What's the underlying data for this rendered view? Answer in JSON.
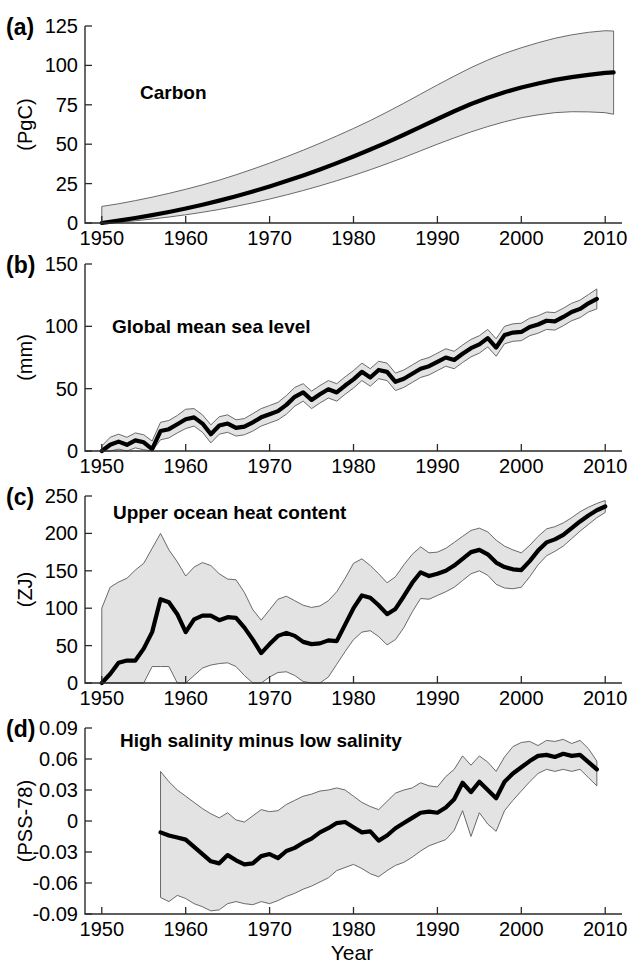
{
  "figure": {
    "x_axis_title": "Year",
    "x_ticks": [
      1950,
      1960,
      1970,
      1980,
      1990,
      2000,
      2010
    ],
    "x_range": [
      1948,
      2012
    ],
    "band_fill": "#e3e3e3",
    "band_stroke": "#5a5a5a",
    "line_color": "#000000"
  },
  "chart_data": [
    {
      "type": "area",
      "panel": "a",
      "panel_letter": "(a)",
      "title": "Carbon",
      "ylabel": "(PgC)",
      "xlabel": "",
      "ylim": [
        0,
        125
      ],
      "yticks": [
        0,
        25,
        50,
        75,
        100,
        125
      ],
      "ytick_labels": [
        "0",
        "25",
        "50",
        "75",
        "100",
        "125"
      ],
      "xlim": [
        1948,
        2012
      ],
      "grid": false,
      "legend": "none",
      "x": [
        1950,
        1952,
        1954,
        1956,
        1958,
        1960,
        1962,
        1964,
        1966,
        1968,
        1970,
        1972,
        1974,
        1976,
        1978,
        1980,
        1982,
        1984,
        1986,
        1988,
        1990,
        1992,
        1994,
        1996,
        1998,
        2000,
        2002,
        2004,
        2006,
        2008,
        2010,
        2011
      ],
      "series": [
        {
          "name": "mean",
          "values": [
            0.0,
            1.5,
            3.2,
            5.0,
            7.0,
            9.2,
            11.6,
            14.2,
            17.0,
            20.0,
            23.2,
            26.6,
            30.2,
            34.0,
            38.0,
            42.2,
            46.6,
            51.2,
            56.0,
            61.0,
            66.0,
            70.9,
            75.5,
            79.5,
            83.0,
            86.0,
            88.5,
            90.8,
            92.6,
            94.0,
            95.2,
            95.6
          ]
        },
        {
          "name": "upper_bound",
          "values": [
            10.5,
            12.2,
            14.2,
            16.4,
            18.8,
            21.4,
            24.2,
            27.2,
            30.6,
            34.2,
            38.0,
            42.0,
            46.2,
            50.6,
            55.2,
            60.0,
            65.0,
            70.4,
            76.0,
            81.8,
            87.6,
            93.2,
            98.6,
            103.4,
            107.6,
            111.2,
            114.4,
            117.2,
            119.4,
            121.0,
            122.0,
            121.8
          ]
        },
        {
          "name": "lower_bound",
          "values": [
            -0.5,
            0.4,
            1.4,
            2.5,
            3.8,
            5.2,
            6.8,
            8.6,
            10.6,
            12.8,
            15.2,
            17.8,
            20.6,
            23.6,
            26.8,
            30.2,
            33.8,
            37.6,
            41.6,
            45.8,
            50.0,
            54.0,
            57.8,
            61.2,
            64.2,
            66.8,
            68.6,
            70.0,
            70.6,
            70.5,
            70.0,
            69.0
          ]
        }
      ]
    },
    {
      "type": "area",
      "panel": "b",
      "panel_letter": "(b)",
      "title": "Global mean sea level",
      "ylabel": "(mm)",
      "xlabel": "",
      "ylim": [
        0,
        150
      ],
      "yticks": [
        0,
        50,
        100,
        150
      ],
      "ytick_labels": [
        "0",
        "50",
        "100",
        "150"
      ],
      "xlim": [
        1948,
        2012
      ],
      "grid": false,
      "legend": "none",
      "x": [
        1950,
        1951,
        1952,
        1953,
        1954,
        1955,
        1956,
        1957,
        1958,
        1959,
        1960,
        1961,
        1962,
        1963,
        1964,
        1965,
        1966,
        1967,
        1968,
        1969,
        1970,
        1971,
        1972,
        1973,
        1974,
        1975,
        1976,
        1977,
        1978,
        1979,
        1980,
        1981,
        1982,
        1983,
        1984,
        1985,
        1986,
        1987,
        1988,
        1989,
        1990,
        1991,
        1992,
        1993,
        1994,
        1995,
        1996,
        1997,
        1998,
        1999,
        2000,
        2001,
        2002,
        2003,
        2004,
        2005,
        2006,
        2007,
        2008,
        2009
      ],
      "series": [
        {
          "name": "mean",
          "values": [
            -2.0,
            5.0,
            7.5,
            5.0,
            8.5,
            7.0,
            1.5,
            16.0,
            17.5,
            21.5,
            25.5,
            27.0,
            22.0,
            13.5,
            20.5,
            22.0,
            18.5,
            19.5,
            23.0,
            27.0,
            29.5,
            32.0,
            37.0,
            43.5,
            47.0,
            41.0,
            45.5,
            49.5,
            47.0,
            52.5,
            57.5,
            63.5,
            59.0,
            65.0,
            63.5,
            55.5,
            58.0,
            62.0,
            66.0,
            68.0,
            71.5,
            75.0,
            73.0,
            78.0,
            82.5,
            85.5,
            90.5,
            83.0,
            93.0,
            95.0,
            95.5,
            99.5,
            101.5,
            104.5,
            104.0,
            107.5,
            111.5,
            114.0,
            118.5,
            122.0
          ]
        },
        {
          "name": "upper_bound",
          "values": [
            4.0,
            11.0,
            13.5,
            11.0,
            14.5,
            13.0,
            8.0,
            23.0,
            24.5,
            28.5,
            33.5,
            34.0,
            29.0,
            21.0,
            27.5,
            29.0,
            25.0,
            26.0,
            30.0,
            34.0,
            36.5,
            39.0,
            44.5,
            51.0,
            54.0,
            48.0,
            52.5,
            56.5,
            54.0,
            59.5,
            64.5,
            70.5,
            66.0,
            72.0,
            70.5,
            62.5,
            65.0,
            69.0,
            73.0,
            75.0,
            78.5,
            82.0,
            80.0,
            85.0,
            89.5,
            92.5,
            97.5,
            90.0,
            100.0,
            102.0,
            102.5,
            106.5,
            108.5,
            111.5,
            111.0,
            114.5,
            118.5,
            121.0,
            125.5,
            130.0
          ]
        },
        {
          "name": "lower_bound",
          "values": [
            -8.0,
            -1.0,
            1.5,
            -1.0,
            2.5,
            1.0,
            -5.0,
            9.0,
            10.5,
            14.5,
            18.0,
            20.0,
            15.0,
            6.5,
            13.5,
            15.0,
            12.0,
            13.0,
            16.0,
            20.0,
            22.5,
            25.0,
            29.5,
            36.0,
            40.0,
            34.0,
            38.5,
            42.5,
            40.0,
            45.5,
            50.5,
            56.5,
            52.0,
            58.0,
            56.5,
            48.5,
            51.0,
            55.0,
            59.0,
            61.0,
            64.5,
            68.0,
            66.0,
            71.0,
            75.5,
            78.5,
            83.5,
            76.0,
            86.0,
            88.0,
            88.5,
            92.5,
            94.5,
            97.5,
            97.0,
            100.5,
            104.5,
            107.0,
            111.5,
            114.0
          ]
        }
      ]
    },
    {
      "type": "area",
      "panel": "c",
      "panel_letter": "(c)",
      "title": "Upper ocean heat content",
      "ylabel": "(ZJ)",
      "xlabel": "",
      "ylim": [
        0,
        250
      ],
      "yticks": [
        0,
        50,
        100,
        150,
        200,
        250
      ],
      "ytick_labels": [
        "0",
        "50",
        "100",
        "150",
        "200",
        "250"
      ],
      "xlim": [
        1948,
        2012
      ],
      "grid": false,
      "legend": "none",
      "x": [
        1950,
        1951,
        1952,
        1953,
        1954,
        1955,
        1956,
        1957,
        1958,
        1959,
        1960,
        1961,
        1962,
        1963,
        1964,
        1965,
        1966,
        1967,
        1968,
        1969,
        1970,
        1971,
        1972,
        1973,
        1974,
        1975,
        1976,
        1977,
        1978,
        1979,
        1980,
        1981,
        1982,
        1983,
        1984,
        1985,
        1986,
        1987,
        1988,
        1989,
        1990,
        1991,
        1992,
        1993,
        1994,
        1995,
        1996,
        1997,
        1998,
        1999,
        2000,
        2001,
        2002,
        2003,
        2004,
        2005,
        2006,
        2007,
        2008,
        2009,
        2010
      ],
      "series": [
        {
          "name": "mean",
          "values": [
            0,
            12,
            27,
            30,
            30,
            46,
            68,
            112,
            108,
            92,
            68,
            85,
            90,
            90,
            84,
            88,
            87,
            74,
            58,
            40,
            52,
            63,
            67,
            63,
            55,
            52,
            53,
            57,
            56,
            78,
            100,
            117,
            114,
            104,
            92,
            99,
            116,
            134,
            148,
            143,
            146,
            150,
            157,
            166,
            175,
            178,
            172,
            161,
            155,
            152,
            151,
            163,
            177,
            188,
            192,
            198,
            207,
            216,
            224,
            231,
            236
          ]
        },
        {
          "name": "upper_bound",
          "values": [
            100,
            128,
            135,
            140,
            151,
            160,
            180,
            200,
            178,
            162,
            143,
            155,
            161,
            157,
            146,
            139,
            138,
            121,
            98,
            84,
            98,
            112,
            116,
            110,
            104,
            101,
            103,
            110,
            122,
            140,
            160,
            166,
            157,
            146,
            134,
            142,
            158,
            172,
            182,
            174,
            175,
            180,
            188,
            196,
            204,
            207,
            202,
            191,
            183,
            178,
            174,
            184,
            196,
            206,
            209,
            214,
            221,
            229,
            235,
            240,
            244
          ]
        },
        {
          "name": "lower_bound",
          "values": [
            0,
            0,
            0,
            0,
            0,
            0,
            22,
            22,
            22,
            0,
            0,
            10,
            20,
            24,
            26,
            27,
            22,
            10,
            0,
            0,
            8,
            14,
            15,
            10,
            2,
            0,
            0,
            8,
            25,
            42,
            58,
            68,
            70,
            62,
            51,
            58,
            74,
            95,
            113,
            112,
            117,
            122,
            128,
            137,
            146,
            150,
            144,
            132,
            127,
            126,
            128,
            142,
            158,
            170,
            176,
            183,
            193,
            203,
            212,
            221,
            228
          ]
        }
      ]
    },
    {
      "type": "area",
      "panel": "d",
      "panel_letter": "(d)",
      "title": "High salinity minus low salinity",
      "ylabel": "(PSS-78)",
      "xlabel": "Year",
      "ylim": [
        -0.09,
        0.09
      ],
      "yticks": [
        -0.09,
        -0.06,
        -0.03,
        0,
        0.03,
        0.06,
        0.09
      ],
      "ytick_labels": [
        "-0.09",
        "-0.06",
        "-0.03",
        "0",
        "0.03",
        "0.06",
        "0.09"
      ],
      "xlim": [
        1948,
        2012
      ],
      "grid": false,
      "legend": "none",
      "x": [
        1957,
        1958,
        1959,
        1960,
        1961,
        1962,
        1963,
        1964,
        1965,
        1966,
        1967,
        1968,
        1969,
        1970,
        1971,
        1972,
        1973,
        1974,
        1975,
        1976,
        1977,
        1978,
        1979,
        1980,
        1981,
        1982,
        1983,
        1984,
        1985,
        1986,
        1987,
        1988,
        1989,
        1990,
        1991,
        1992,
        1993,
        1994,
        1995,
        1996,
        1997,
        1998,
        1999,
        2000,
        2001,
        2002,
        2003,
        2004,
        2005,
        2006,
        2007,
        2008,
        2009
      ],
      "series": [
        {
          "name": "mean",
          "values": [
            -0.011,
            -0.014,
            -0.016,
            -0.018,
            -0.025,
            -0.032,
            -0.039,
            -0.041,
            -0.033,
            -0.038,
            -0.042,
            -0.041,
            -0.034,
            -0.032,
            -0.036,
            -0.029,
            -0.026,
            -0.021,
            -0.017,
            -0.011,
            -0.007,
            -0.002,
            -0.001,
            -0.006,
            -0.011,
            -0.01,
            -0.019,
            -0.014,
            -0.007,
            -0.002,
            0.003,
            0.008,
            0.009,
            0.008,
            0.013,
            0.021,
            0.037,
            0.028,
            0.038,
            0.03,
            0.022,
            0.038,
            0.046,
            0.052,
            0.058,
            0.063,
            0.064,
            0.062,
            0.065,
            0.063,
            0.064,
            0.057,
            0.05
          ]
        },
        {
          "name": "upper_bound",
          "values": [
            0.048,
            0.038,
            0.03,
            0.024,
            0.018,
            0.012,
            0.007,
            0.003,
            0.008,
            0.001,
            -0.001,
            0.005,
            0.011,
            0.009,
            0.01,
            0.016,
            0.02,
            0.024,
            0.026,
            0.029,
            0.03,
            0.032,
            0.03,
            0.024,
            0.018,
            0.014,
            0.011,
            0.019,
            0.027,
            0.03,
            0.032,
            0.037,
            0.034,
            0.033,
            0.043,
            0.05,
            0.063,
            0.054,
            0.063,
            0.057,
            0.048,
            0.062,
            0.072,
            0.076,
            0.077,
            0.073,
            0.078,
            0.077,
            0.079,
            0.075,
            0.078,
            0.07,
            0.058
          ]
        },
        {
          "name": "lower_bound",
          "values": [
            -0.074,
            -0.078,
            -0.072,
            -0.075,
            -0.08,
            -0.083,
            -0.087,
            -0.086,
            -0.08,
            -0.078,
            -0.08,
            -0.081,
            -0.078,
            -0.08,
            -0.077,
            -0.073,
            -0.07,
            -0.066,
            -0.063,
            -0.059,
            -0.055,
            -0.048,
            -0.045,
            -0.042,
            -0.046,
            -0.051,
            -0.054,
            -0.048,
            -0.043,
            -0.04,
            -0.035,
            -0.029,
            -0.024,
            -0.021,
            -0.018,
            -0.009,
            0.01,
            -0.015,
            0.008,
            -0.003,
            -0.01,
            0.01,
            0.02,
            0.029,
            0.038,
            0.046,
            0.05,
            0.048,
            0.05,
            0.048,
            0.05,
            0.042,
            0.034
          ]
        }
      ]
    }
  ]
}
